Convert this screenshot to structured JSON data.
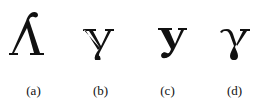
{
  "figure": {
    "panels": [
      {
        "id": "a",
        "label": "(a)",
        "glyph": "lambda-like-turned-y"
      },
      {
        "id": "b",
        "label": "(b)",
        "glyph": "y-with-looped-descender"
      },
      {
        "id": "c",
        "label": "(c)",
        "glyph": "y-letter"
      },
      {
        "id": "d",
        "label": "(d)",
        "glyph": "gamma-like-y"
      }
    ],
    "colors": {
      "ink": "#111111",
      "background": "#ffffff"
    }
  }
}
